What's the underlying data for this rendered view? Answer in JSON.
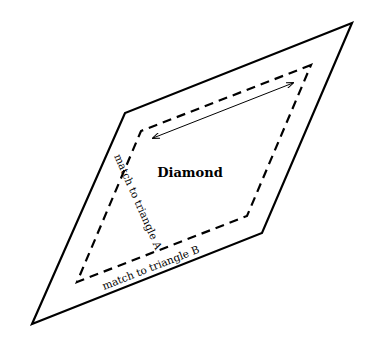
{
  "diagram": {
    "title": "Diamond",
    "labels": {
      "left_edge": "match to triangle A",
      "bottom_edge": "match to triangle B"
    },
    "colors": {
      "background": "#ffffff",
      "stroke": "#000000"
    },
    "outer_shape": {
      "type": "parallelogram",
      "stroke": "solid",
      "points": [
        [
          352,
          23
        ],
        [
          125,
          113
        ],
        [
          32,
          324
        ],
        [
          262,
          233
        ]
      ]
    },
    "inner_shape": {
      "type": "parallelogram",
      "stroke": "dashed",
      "points": [
        [
          311,
          65
        ],
        [
          141,
          131
        ],
        [
          77,
          282
        ],
        [
          247,
          216
        ]
      ]
    },
    "arrow": {
      "type": "double-headed",
      "from": [
        153,
        138
      ],
      "to": [
        293,
        83
      ]
    }
  }
}
